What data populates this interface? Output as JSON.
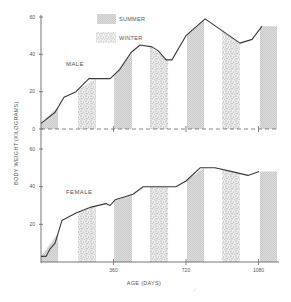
{
  "chart_data": {
    "type": "line",
    "title": "",
    "xlabel": "AGE (DAYS)",
    "ylabel": "BODY WEIGHT (KILOGRAMS)",
    "xlim": [
      0,
      1120
    ],
    "x_ticks": [
      360,
      720,
      1080
    ],
    "x_tick_labels": [
      "360",
      "720",
      "1080"
    ],
    "legend": [
      {
        "name": "SUMMER",
        "pattern": "fine-hatch",
        "color": "#d4d4d4"
      },
      {
        "name": "WINTER",
        "pattern": "stipple",
        "color": "#bdbdbd"
      }
    ],
    "legend_position": "top-center",
    "grid": false,
    "season_bands": [
      {
        "season": "SUMMER",
        "start_day": 0,
        "end_day": 85
      },
      {
        "season": "WINTER",
        "start_day": 184,
        "end_day": 273
      },
      {
        "season": "SUMMER",
        "start_day": 363,
        "end_day": 452
      },
      {
        "season": "WINTER",
        "start_day": 541,
        "end_day": 631
      },
      {
        "season": "SUMMER",
        "start_day": 725,
        "end_day": 810
      },
      {
        "season": "WINTER",
        "start_day": 899,
        "end_day": 988
      },
      {
        "season": "SUMMER",
        "start_day": 1087,
        "end_day": 1172
      }
    ],
    "panels": [
      {
        "name": "MALE",
        "ylim": [
          0,
          60
        ],
        "y_ticks": [
          0,
          20,
          40,
          60
        ],
        "y_tick_labels": [
          "0",
          "20",
          "40",
          "60"
        ],
        "baseline": "dashed",
        "series": [
          {
            "name": "MALE",
            "x": [
              0,
              70,
              114,
              174,
              238,
              298,
              343,
              392,
              447,
              492,
              551,
              581,
              621,
              650,
              720,
              815,
              988,
              1048,
              1097
            ],
            "values": [
              3,
              9,
              17,
              20,
              27,
              27,
              27,
              32,
              41,
              45,
              44,
              42,
              37,
              37,
              50,
              59,
              46,
              48,
              55
            ]
          }
        ]
      },
      {
        "name": "FEMALE",
        "ylim": [
          0,
          60
        ],
        "y_ticks": [
          20,
          40,
          60
        ],
        "y_tick_labels": [
          "20",
          "40",
          "60"
        ],
        "baseline": "solid",
        "series": [
          {
            "name": "FEMALE",
            "x": [
              0,
              25,
              45,
              70,
              104,
              174,
              243,
              323,
              343,
              368,
              457,
              507,
              596,
              670,
              720,
              790,
              864,
              949,
              1028,
              1083
            ],
            "values": [
              3,
              3,
              7,
              10,
              22,
              26,
              29,
              31,
              30,
              33,
              36,
              40,
              40,
              40,
              43,
              50,
              50,
              48,
              46,
              48
            ]
          }
        ]
      }
    ]
  }
}
